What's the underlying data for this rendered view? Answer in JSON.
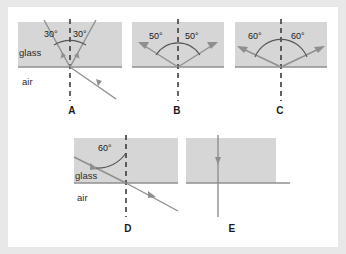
{
  "figure": {
    "background_color": "#e8e8e8",
    "panel_background": "#ffffff",
    "glass_fill": "#d6d6d6",
    "glass_stroke": "#9a9a9a",
    "ray_color": "#8a8a8a",
    "normal_color": "#4a4a4a",
    "text_color": "#1a1a1a"
  },
  "panels": [
    {
      "id": "A",
      "label": "A",
      "media": {
        "upper": "glass",
        "lower": "air"
      },
      "show_media_labels": true,
      "normal_style": "dashed",
      "angles": [
        {
          "value": "30°",
          "side": "left"
        },
        {
          "value": "30°",
          "side": "right"
        }
      ],
      "rays": [
        {
          "name": "upper-left-ray",
          "region": "glass",
          "arrow": "toward-interface"
        },
        {
          "name": "upper-right-ray",
          "region": "glass",
          "arrow": "toward-interface"
        },
        {
          "name": "lower-right-ray",
          "region": "air",
          "arrow": "toward-interface"
        }
      ]
    },
    {
      "id": "B",
      "label": "B",
      "media": {
        "upper": "",
        "lower": ""
      },
      "show_media_labels": false,
      "normal_style": "dashed",
      "angles": [
        {
          "value": "50°",
          "side": "left"
        },
        {
          "value": "50°",
          "side": "right"
        }
      ],
      "rays": [
        {
          "name": "upper-left-ray",
          "region": "glass",
          "arrow": "away-from-interface"
        },
        {
          "name": "upper-right-ray",
          "region": "glass",
          "arrow": "away-from-interface"
        }
      ]
    },
    {
      "id": "C",
      "label": "C",
      "media": {
        "upper": "",
        "lower": ""
      },
      "show_media_labels": false,
      "normal_style": "dashed",
      "angles": [
        {
          "value": "60°",
          "side": "left"
        },
        {
          "value": "60°",
          "side": "right"
        }
      ],
      "rays": [
        {
          "name": "upper-left-ray",
          "region": "glass",
          "arrow": "away-from-interface"
        },
        {
          "name": "upper-right-ray",
          "region": "glass",
          "arrow": "away-from-interface"
        }
      ]
    },
    {
      "id": "D",
      "label": "D",
      "media": {
        "upper": "glass",
        "lower": "air"
      },
      "show_media_labels": true,
      "normal_style": "dashed",
      "angles": [
        {
          "value": "60°",
          "side": "left"
        }
      ],
      "rays": [
        {
          "name": "incident-ray",
          "region": "glass",
          "arrow": "toward-interface"
        },
        {
          "name": "transmitted-ray",
          "region": "air",
          "arrow": "away-from-interface"
        }
      ]
    },
    {
      "id": "E",
      "label": "E",
      "media": {
        "upper": "",
        "lower": ""
      },
      "show_media_labels": false,
      "normal_style": "solid",
      "angles": [],
      "rays": [
        {
          "name": "perpendicular-ray",
          "region": "both",
          "arrow": "downward"
        }
      ]
    }
  ],
  "labels": {
    "glass": "glass",
    "air": "air",
    "a": "A",
    "b": "B",
    "c": "C",
    "d": "D",
    "e": "E",
    "angle_30_left": "30°",
    "angle_30_right": "30°",
    "angle_50_left": "50°",
    "angle_50_right": "50°",
    "angle_60_left": "60°",
    "angle_60_right": "60°",
    "angle_60_d": "60°"
  }
}
